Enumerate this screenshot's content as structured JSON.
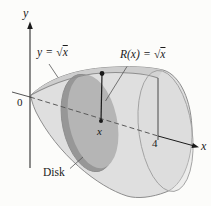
{
  "figure": {
    "labels": {
      "y_axis": "y",
      "x_axis": "x",
      "origin": "0",
      "x_tick": "4",
      "sample_point": "x",
      "disk": "Disk",
      "curve": {
        "lhs": "y",
        "eq": "=",
        "radical": "√",
        "radicand": "x"
      },
      "radius": {
        "lhs": "R(x)",
        "eq": "=",
        "radical": "√",
        "radicand": "x"
      }
    },
    "colors": {
      "background": "#fcfcfa",
      "body": "#dfdfdf",
      "band": "#cdcdcd",
      "base_fill": "#dcdcdc",
      "disk": "#b5b5b5",
      "disk_dark": "#979797",
      "outline": "#8e8e8e",
      "thin_outline": "#a0a0a0",
      "line": "#1a1a1a",
      "leader": "#555555"
    }
  }
}
